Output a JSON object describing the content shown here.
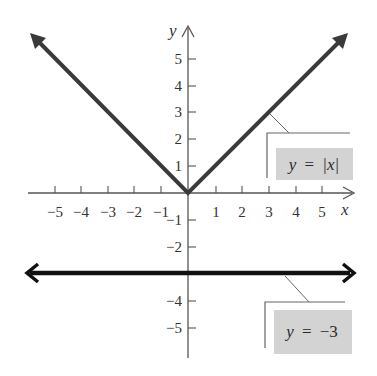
{
  "chart_data": {
    "type": "line",
    "title": "",
    "xlabel": "x",
    "ylabel": "y",
    "xlim": [
      -5.8,
      6.3
    ],
    "ylim": [
      -6.2,
      6.0
    ],
    "grid": false,
    "x_ticks": [
      -5,
      -4,
      -3,
      -2,
      -1,
      1,
      2,
      3,
      4,
      5
    ],
    "y_ticks": [
      -5,
      -4,
      -2,
      -1,
      1,
      2,
      3,
      4,
      5
    ],
    "x_tick_labels": [
      "−5",
      "−4",
      "−3",
      "−2",
      "−1",
      "1",
      "2",
      "3",
      "4",
      "5"
    ],
    "y_tick_labels": [
      "−5",
      "−4",
      "−2",
      "−1",
      "1",
      "2",
      "3",
      "4",
      "5"
    ],
    "series": [
      {
        "name": "y = |x|",
        "equation": "y = |x|",
        "x": [
          -5.8,
          -5,
          -4,
          -3,
          -2,
          -1,
          0,
          1,
          2,
          3,
          4,
          5,
          5.9
        ],
        "y": [
          5.8,
          5,
          4,
          3,
          2,
          1,
          0,
          1,
          2,
          3,
          4,
          5,
          5.9
        ],
        "color": "#3a3a3a",
        "arrows": "both ends"
      },
      {
        "name": "y = −3",
        "equation": "y = −3",
        "x": [
          -6,
          6
        ],
        "y": [
          -3,
          -3
        ],
        "color": "#111111",
        "arrows": "both ends"
      }
    ],
    "annotations": [
      {
        "text": "y = |x|",
        "points_to": "y = |x| line near x = 3.3",
        "background": "#d3d3d3"
      },
      {
        "text": "y = −3",
        "points_to": "y = −3 line near x = 3.6",
        "background": "#d3d3d3"
      }
    ]
  },
  "labels": {
    "x_axis": "x",
    "y_axis": "y",
    "abs_label": {
      "prefix": "y",
      "equals": "=",
      "body": "|x|"
    },
    "const_label": {
      "prefix": "y",
      "equals": "=",
      "body": "−3"
    },
    "x_ticks": [
      {
        "text": "−5",
        "x": 55
      },
      {
        "text": "−4",
        "x": 81
      },
      {
        "text": "−3",
        "x": 108
      },
      {
        "text": "−2",
        "x": 134
      },
      {
        "text": "−1",
        "x": 161
      },
      {
        "text": "1",
        "x": 216
      },
      {
        "text": "2",
        "x": 242
      },
      {
        "text": "3",
        "x": 269
      },
      {
        "text": "4",
        "x": 296
      },
      {
        "text": "5",
        "x": 322
      }
    ],
    "y_ticks": [
      {
        "text": "5",
        "y": 59
      },
      {
        "text": "4",
        "y": 86
      },
      {
        "text": "3",
        "y": 112
      },
      {
        "text": "2",
        "y": 139
      },
      {
        "text": "1",
        "y": 166
      },
      {
        "text": "−1",
        "y": 220
      },
      {
        "text": "−2",
        "y": 247
      },
      {
        "text": "−4",
        "y": 301
      },
      {
        "text": "−5",
        "y": 328
      }
    ]
  },
  "colors": {
    "axis": "#555555",
    "abs_line": "#3a3a3a",
    "const_line": "#111111",
    "label_bg": "#d3d3d3",
    "bracket": "#666666"
  }
}
